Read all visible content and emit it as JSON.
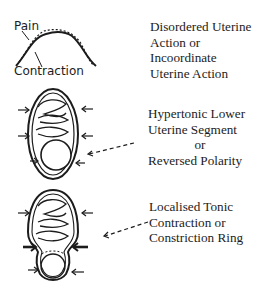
{
  "diagram": {
    "panels": [
      {
        "figure": "pain-contraction-curve",
        "annotations": [
          "Pain",
          "Contraction"
        ],
        "caption_lines": [
          "Disordered Uterine",
          "Action or",
          "Incoordinate",
          "Uterine Action"
        ]
      },
      {
        "figure": "uterus-hypertonic-lower-segment",
        "caption_lines": [
          "Hypertonic Lower",
          "Uterine Segment",
          "or",
          "Reversed Polarity"
        ]
      },
      {
        "figure": "uterus-constriction-ring",
        "caption_lines": [
          "Localised Tonic",
          "Contraction or",
          "Constriction Ring"
        ]
      }
    ]
  }
}
